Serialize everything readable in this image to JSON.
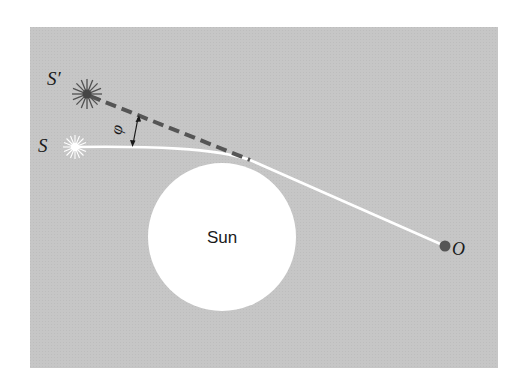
{
  "diagram": {
    "colors": {
      "background": "#ffffff",
      "panel": "#c4c4c4",
      "sun": "#ffffff",
      "light_path": "#ffffff",
      "apparent_line": "#555555",
      "apparent_star": "#555555",
      "observer": "#555555",
      "text": "#1a1a1a"
    },
    "labels": {
      "apparent_star": "S′",
      "true_star": "S",
      "angle": "φ",
      "sun": "Sun",
      "observer": "O"
    },
    "elements": {
      "sun": {
        "cx": 222,
        "cy": 237,
        "r": 74
      },
      "true_star": {
        "x": 75,
        "y": 147
      },
      "apparent_star": {
        "x": 87,
        "y": 94
      },
      "observer": {
        "x": 445,
        "y": 246
      },
      "tangent_point": {
        "x": 250,
        "y": 160
      }
    }
  }
}
